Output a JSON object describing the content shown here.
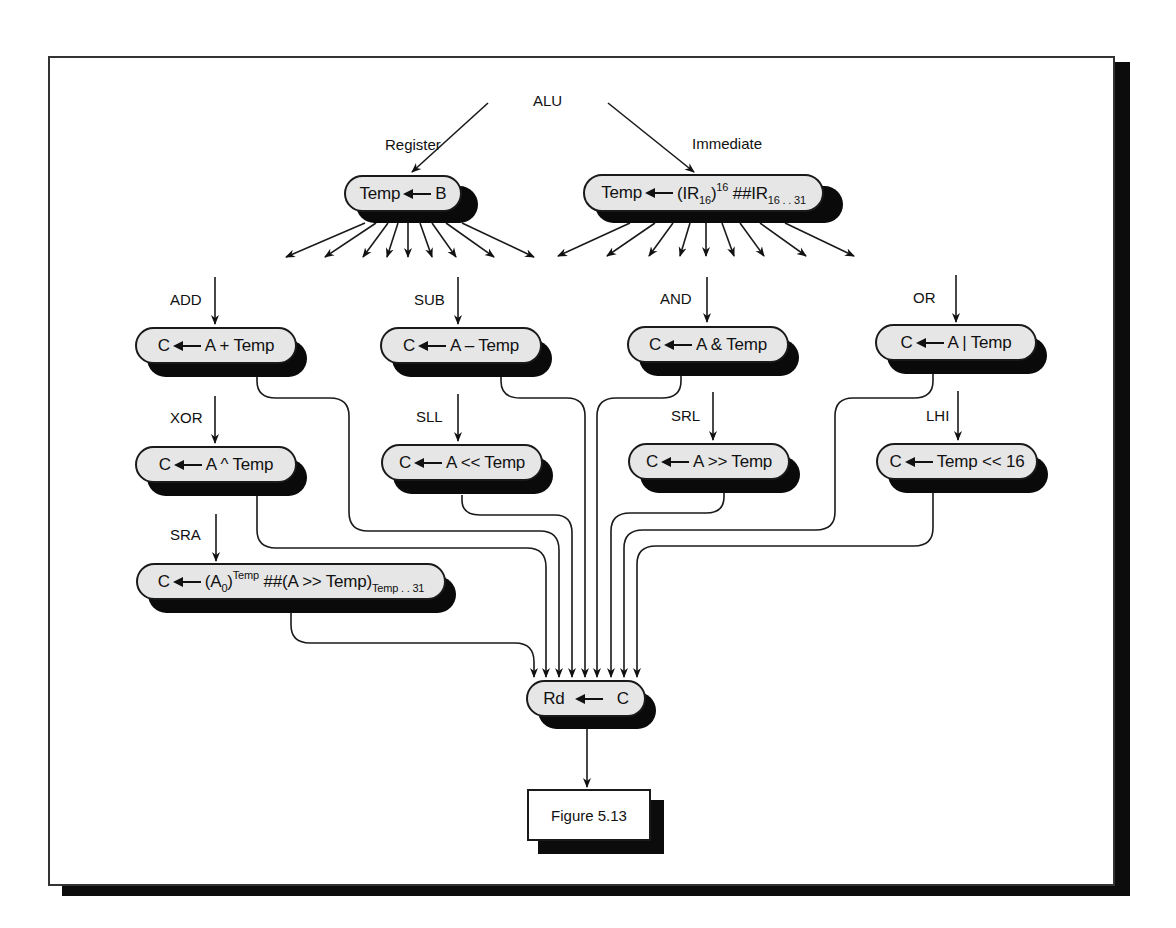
{
  "diagram": {
    "root_label": "ALU",
    "branches": [
      {
        "label": "Register",
        "state": {
          "dest": "Temp",
          "expr_parts": [
            "B"
          ]
        }
      },
      {
        "label": "Immediate",
        "state": {
          "dest": "Temp",
          "expr_parts": [
            "(IR",
            "16",
            ")",
            "16",
            " ##IR",
            "16 . . 31"
          ]
        }
      }
    ],
    "operations": [
      {
        "op": "ADD",
        "dest": "C",
        "expr": "A + Temp"
      },
      {
        "op": "SUB",
        "dest": "C",
        "expr": "A – Temp"
      },
      {
        "op": "AND",
        "dest": "C",
        "expr": "A & Temp"
      },
      {
        "op": "OR",
        "dest": "C",
        "expr": "A | Temp"
      },
      {
        "op": "XOR",
        "dest": "C",
        "expr": "A ^ Temp"
      },
      {
        "op": "SLL",
        "dest": "C",
        "expr": "A << Temp"
      },
      {
        "op": "SRL",
        "dest": "C",
        "expr": "A >> Temp"
      },
      {
        "op": "LHI",
        "dest": "C",
        "expr": "Temp << 16"
      },
      {
        "op": "SRA",
        "dest": "C",
        "expr_parts": [
          "(A",
          "0",
          ")",
          "Temp",
          " ##(A >> Temp)",
          "Temp . . 31"
        ]
      }
    ],
    "writeback": {
      "dest": "Rd",
      "src": "C"
    },
    "caption": "Figure 5.13",
    "colors": {
      "pill_fill": "#e6e6e6",
      "shadow": "#0a0a0a",
      "line": "#1a1a1a"
    }
  }
}
